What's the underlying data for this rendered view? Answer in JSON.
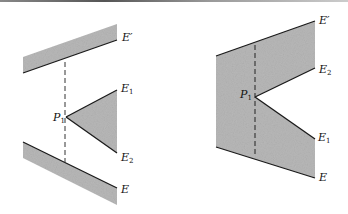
{
  "figure": {
    "shade_color": "#b8b8b8",
    "edge_color": "#1a1a1a",
    "left_panel": {
      "labels": {
        "e_prime": {
          "base": "E",
          "prime": "′"
        },
        "e1": {
          "base": "E",
          "sub": "1"
        },
        "e2": {
          "base": "E",
          "sub": "2"
        },
        "p1": {
          "base": "P",
          "sub": "1"
        },
        "e": {
          "base": "E"
        }
      },
      "shapes": {
        "top_band": [
          [
            23,
            57
          ],
          [
            117,
            24
          ],
          [
            117,
            40
          ],
          [
            23,
            73
          ]
        ],
        "triangle": [
          [
            66,
            117
          ],
          [
            117,
            90
          ],
          [
            117,
            153
          ]
        ],
        "bottom_band": [
          [
            23,
            142
          ],
          [
            117,
            188
          ],
          [
            117,
            205
          ],
          [
            23,
            158
          ]
        ]
      },
      "dashed_line": {
        "x": 65,
        "y1": 62,
        "y2": 162
      }
    },
    "right_panel": {
      "labels": {
        "e_prime": {
          "base": "E",
          "prime": "′"
        },
        "e2": {
          "base": "E",
          "sub": "2"
        },
        "p1": {
          "base": "P",
          "sub": "1"
        },
        "e1": {
          "base": "E",
          "sub": "1"
        },
        "e": {
          "base": "E"
        }
      },
      "shape": [
        [
          216,
          56
        ],
        [
          315,
          21
        ],
        [
          315,
          68
        ],
        [
          255,
          97
        ],
        [
          315,
          139
        ],
        [
          315,
          178
        ],
        [
          216,
          147
        ]
      ],
      "dashed_line": {
        "x": 255,
        "y1": 45,
        "y2": 155
      }
    }
  }
}
